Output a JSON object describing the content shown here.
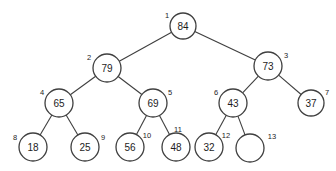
{
  "figure": {
    "kind": "binary-heap-tree-diagram",
    "width": 336,
    "height": 171,
    "background_color": "#ffffff",
    "stroke_color": "#3f3f3f",
    "text_color": "#1d1d1d"
  },
  "chart_data": {
    "type": "diagram",
    "title": "",
    "nodes": [
      {
        "index": "1",
        "value": "84",
        "cx": 183,
        "cy": 26,
        "r": 13,
        "index_dx": -16,
        "index_dy": -11
      },
      {
        "index": "2",
        "value": "79",
        "cx": 107,
        "cy": 68,
        "r": 14,
        "index_dx": -18,
        "index_dy": -11
      },
      {
        "index": "3",
        "value": "73",
        "cx": 268,
        "cy": 66,
        "r": 14,
        "index_dx": 18,
        "index_dy": -11
      },
      {
        "index": "4",
        "value": "65",
        "cx": 59,
        "cy": 103,
        "r": 14,
        "index_dx": -17,
        "index_dy": -11
      },
      {
        "index": "5",
        "value": "69",
        "cx": 153,
        "cy": 103,
        "r": 14,
        "index_dx": 17,
        "index_dy": -11
      },
      {
        "index": "6",
        "value": "43",
        "cx": 233,
        "cy": 103,
        "r": 14,
        "index_dx": -17,
        "index_dy": -11
      },
      {
        "index": "7",
        "value": "37",
        "cx": 311,
        "cy": 103,
        "r": 13,
        "index_dx": 16,
        "index_dy": -11
      },
      {
        "index": "8",
        "value": "18",
        "cx": 33,
        "cy": 147,
        "r": 14,
        "index_dx": -18,
        "index_dy": -10
      },
      {
        "index": "9",
        "value": "25",
        "cx": 85,
        "cy": 147,
        "r": 14,
        "index_dx": 18,
        "index_dy": -10
      },
      {
        "index": "10",
        "value": "56",
        "cx": 130,
        "cy": 147,
        "r": 14,
        "index_dx": 17,
        "index_dy": -12
      },
      {
        "index": "11",
        "value": "48",
        "cx": 176,
        "cy": 147,
        "r": 14,
        "index_dx": 2,
        "index_dy": -18
      },
      {
        "index": "12",
        "value": "32",
        "cx": 209,
        "cy": 147,
        "r": 14,
        "index_dx": 17,
        "index_dy": -12
      },
      {
        "index": "13",
        "value": "",
        "cx": 250,
        "cy": 148,
        "r": 14,
        "index_dx": 22,
        "index_dy": -12
      }
    ],
    "edges": [
      {
        "from": "1",
        "to": "2",
        "label": "root-to-left-child"
      },
      {
        "from": "1",
        "to": "3",
        "label": "root-to-right-child"
      },
      {
        "from": "2",
        "to": "4",
        "label": "n2-to-left-child"
      },
      {
        "from": "2",
        "to": "5",
        "label": "n2-to-right-child"
      },
      {
        "from": "3",
        "to": "6",
        "label": "n3-to-left-child"
      },
      {
        "from": "3",
        "to": "7",
        "label": "n3-to-right-child"
      },
      {
        "from": "4",
        "to": "8",
        "label": "n4-to-left-child"
      },
      {
        "from": "4",
        "to": "9",
        "label": "n4-to-right-child"
      },
      {
        "from": "5",
        "to": "10",
        "label": "n5-to-left-child"
      },
      {
        "from": "5",
        "to": "11",
        "label": "n5-to-right-child"
      },
      {
        "from": "6",
        "to": "12",
        "label": "n6-to-left-child"
      },
      {
        "from": "6",
        "to": "13",
        "label": "n6-to-right-child"
      }
    ]
  }
}
